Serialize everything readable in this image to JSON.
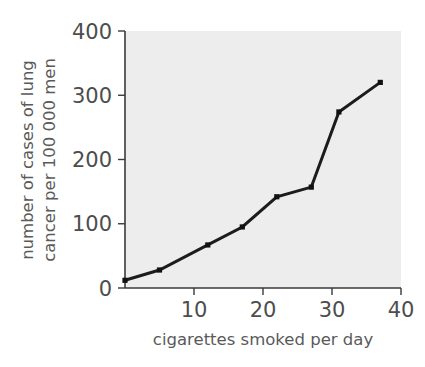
{
  "chart_data": {
    "type": "line",
    "title": "",
    "xlabel": "cigarettes smoked per day",
    "ylabel": "number of cases of lung cancer per 100 000 men",
    "ylabel_line1": "number of cases of lung",
    "ylabel_line2": "cancer per 100 000 men",
    "xlim": [
      0,
      40
    ],
    "ylim": [
      0,
      400
    ],
    "xticks": [
      10,
      20,
      30,
      40
    ],
    "xtick_labels": [
      "10",
      "20",
      "30",
      "40"
    ],
    "yticks": [
      0,
      100,
      200,
      300,
      400
    ],
    "ytick_labels": [
      "0",
      "100",
      "200",
      "300",
      "400"
    ],
    "grid": false,
    "legend": false,
    "series": [
      {
        "name": "lung cancer cases",
        "x": [
          0,
          5,
          12,
          17,
          22,
          27,
          31,
          37
        ],
        "values": [
          12,
          28,
          67,
          95,
          142,
          157,
          274,
          320
        ]
      }
    ],
    "colors": {
      "line": "#1c1c1c",
      "marker": "#111111",
      "plot_background": "#ededed",
      "axis": "#3a3a3a",
      "text": "#4d4d4d",
      "figure_background": "#ffffff"
    }
  },
  "figure": {
    "xaxis_title": "cigarettes smoked per day",
    "yaxis_title_line1": "number of cases of lung",
    "yaxis_title_line2": "cancer per 100 000 men",
    "ytick_400": "400",
    "ytick_300": "300",
    "ytick_200": "200",
    "ytick_100": "100",
    "ytick_0": "0",
    "xtick_10": "10",
    "xtick_20": "20",
    "xtick_30": "30",
    "xtick_40": "40"
  }
}
